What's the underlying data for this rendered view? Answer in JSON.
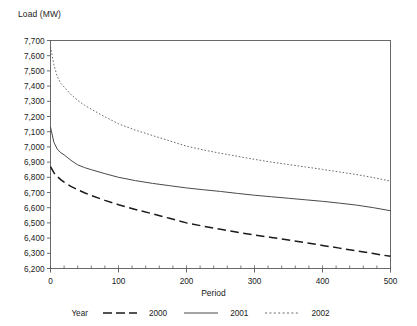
{
  "chart_data": {
    "type": "line",
    "title": "",
    "ylabel": "Load (MW)",
    "xlabel": "Period",
    "xlim": [
      0,
      500
    ],
    "ylim": [
      6200,
      7700
    ],
    "grid": false,
    "legend_position": "bottom",
    "legend_title": "Year",
    "x_ticks": [
      0,
      100,
      200,
      300,
      400,
      500
    ],
    "x_tick_labels": [
      "0",
      "100",
      "200",
      "300",
      "400",
      "500"
    ],
    "x_minor_tick_step": 20,
    "y_ticks": [
      6200,
      6300,
      6400,
      6500,
      6600,
      6700,
      6800,
      6900,
      7000,
      7100,
      7200,
      7300,
      7400,
      7500,
      7600,
      7700
    ],
    "y_tick_labels": [
      "6,200",
      "6,300",
      "6,400",
      "6,500",
      "6,600",
      "6,700",
      "6,800",
      "6,900",
      "7,000",
      "7,100",
      "7,200",
      "7,300",
      "7,400",
      "7,500",
      "7,600",
      "7,700"
    ],
    "x": [
      0,
      5,
      10,
      15,
      20,
      30,
      40,
      50,
      60,
      80,
      100,
      125,
      150,
      175,
      200,
      225,
      250,
      275,
      300,
      325,
      350,
      375,
      400,
      425,
      450,
      475,
      500
    ],
    "series": [
      {
        "name": "2000",
        "label": "2000",
        "style": "dashed",
        "color": "#1a1a1a",
        "values": [
          6870,
          6830,
          6805,
          6785,
          6768,
          6740,
          6718,
          6698,
          6680,
          6648,
          6620,
          6588,
          6560,
          6530,
          6500,
          6478,
          6458,
          6438,
          6420,
          6404,
          6388,
          6370,
          6352,
          6334,
          6316,
          6298,
          6280
        ]
      },
      {
        "name": "2001",
        "label": "2001",
        "style": "solid",
        "color": "#1a1a1a",
        "values": [
          7130,
          7030,
          6985,
          6962,
          6948,
          6912,
          6882,
          6864,
          6850,
          6824,
          6800,
          6778,
          6760,
          6745,
          6730,
          6718,
          6707,
          6694,
          6682,
          6672,
          6662,
          6652,
          6642,
          6630,
          6617,
          6600,
          6580
        ]
      },
      {
        "name": "2002",
        "label": "2002",
        "style": "dotted",
        "color": "#3a3a3a",
        "values": [
          7660,
          7540,
          7462,
          7420,
          7394,
          7345,
          7306,
          7274,
          7248,
          7198,
          7152,
          7110,
          7075,
          7040,
          7005,
          6980,
          6958,
          6938,
          6918,
          6900,
          6884,
          6868,
          6852,
          6835,
          6818,
          6798,
          6775
        ]
      }
    ]
  },
  "legend": {
    "title": "Year",
    "items": [
      {
        "label": "2000",
        "style": "dashed"
      },
      {
        "label": "2001",
        "style": "solid"
      },
      {
        "label": "2002",
        "style": "dotted"
      }
    ]
  }
}
